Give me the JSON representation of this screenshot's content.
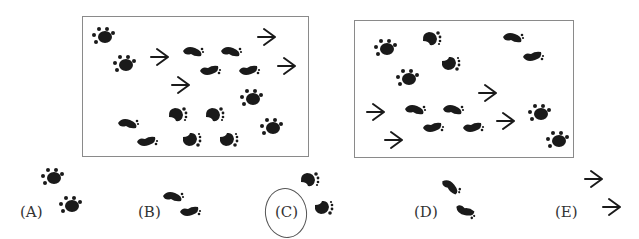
{
  "panels": [
    {
      "name": "track-panel-left"
    },
    {
      "name": "track-panel-right"
    }
  ],
  "options": [
    {
      "label": "(A)",
      "tracks": "two paw prints"
    },
    {
      "label": "(B)",
      "tracks": "two human footprints"
    },
    {
      "label": "(C)",
      "tracks": "two bare footprints with toes",
      "circled": true
    },
    {
      "label": "(D)",
      "tracks": "two human footprints"
    },
    {
      "label": "(E)",
      "tracks": "two bird tracks"
    }
  ],
  "colors": {
    "ink": "#1a1a1a",
    "border": "#8a8a8a"
  }
}
